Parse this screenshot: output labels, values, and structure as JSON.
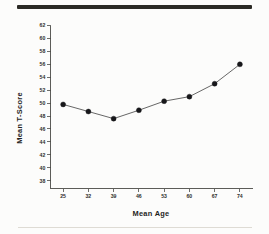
{
  "figure": {
    "background_color": "#fcfcfb",
    "top_rule_color": "#2b2a25",
    "bottom_rule_color": "#dedbd4"
  },
  "chart_data": {
    "type": "line",
    "title": "",
    "subtitle": "",
    "xlabel": "Mean  Age",
    "ylabel": "Mean   T-Score",
    "x": [
      25,
      32,
      39,
      46,
      53,
      60,
      67,
      74
    ],
    "values": [
      49.8,
      48.7,
      47.6,
      48.9,
      50.3,
      51.0,
      53.0,
      56.0
    ],
    "series": [
      {
        "name": "Mean T-Score",
        "values": [
          49.8,
          48.7,
          47.6,
          48.9,
          50.3,
          51.0,
          53.0,
          56.0
        ]
      }
    ],
    "categories": [
      "25",
      "32",
      "39",
      "46",
      "53",
      "60",
      "67",
      "74"
    ],
    "xtick_labels": [
      "25",
      "32",
      "39",
      "46",
      "53",
      "60",
      "67",
      "74"
    ],
    "ytick_labels": [
      "38",
      "40",
      "42",
      "44",
      "46",
      "48",
      "50",
      "52",
      "54",
      "56",
      "58",
      "60",
      "62"
    ],
    "ytick_values": [
      38,
      40,
      42,
      44,
      46,
      48,
      50,
      52,
      54,
      56,
      58,
      60,
      62
    ],
    "xlim": [
      21.5,
      77.5
    ],
    "ylim": [
      36.8,
      62
    ],
    "grid": false,
    "legend": null,
    "legend_position": "none",
    "marker": "filled-circle",
    "line_color": "#4c4c4c",
    "marker_color": "#17171a",
    "axis_color": "#4a4a46"
  }
}
